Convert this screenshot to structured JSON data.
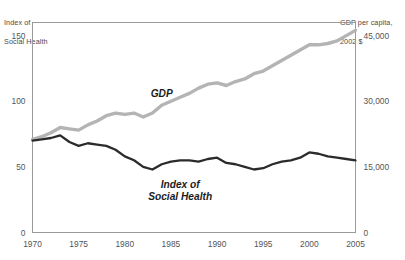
{
  "chart_data": {
    "type": "line",
    "title": "",
    "xlabel": "",
    "ylabel": "Index of\nSocial Health",
    "y2label": "GDP per capita,\n2002 $",
    "grid": false,
    "legend_position": "inline-annotations",
    "xlim": [
      1970,
      2005
    ],
    "ylim": [
      0,
      160
    ],
    "y2lim": [
      0,
      48000
    ],
    "xticks": [
      "1970",
      "1975",
      "1980",
      "1985",
      "1990",
      "1995",
      "2000",
      "2005"
    ],
    "xtick_values": [
      1970,
      1975,
      1980,
      1985,
      1990,
      1995,
      2000,
      2005
    ],
    "yticks": [
      "0",
      "50",
      "100",
      "150"
    ],
    "ytick_values": [
      0,
      50,
      100,
      150
    ],
    "y2ticks": [
      "0",
      "15,000",
      "30,000",
      "45,000"
    ],
    "y2tick_values": [
      0,
      15000,
      30000,
      45000
    ],
    "x": [
      1970,
      1971,
      1972,
      1973,
      1974,
      1975,
      1976,
      1977,
      1978,
      1979,
      1980,
      1981,
      1982,
      1983,
      1984,
      1985,
      1986,
      1987,
      1988,
      1989,
      1990,
      1991,
      1992,
      1993,
      1994,
      1995,
      1996,
      1997,
      1998,
      1999,
      2000,
      2001,
      2002,
      2003,
      2004,
      2005
    ],
    "series": [
      {
        "name": "GDP",
        "axis": "right",
        "color": "#b4b4b4",
        "label_x": 1984,
        "label_y": 103,
        "values": [
          71,
          73,
          76,
          80,
          79,
          78,
          82,
          85,
          89,
          91,
          90,
          91,
          88,
          91,
          97,
          100,
          103,
          106,
          110,
          113,
          114,
          112,
          115,
          117,
          121,
          123,
          127,
          131,
          135,
          139,
          143,
          143,
          144,
          146,
          150,
          154
        ]
      },
      {
        "name": "Index of\nSocial Health",
        "axis": "left",
        "color": "#2b2b2b",
        "label_x": 1986,
        "label_y": 34,
        "values": [
          70,
          71,
          72,
          74,
          69,
          66,
          68,
          67,
          66,
          63,
          58,
          55,
          50,
          48,
          52,
          54,
          55,
          55,
          54,
          56,
          57,
          53,
          52,
          50,
          48,
          49,
          52,
          54,
          55,
          57,
          61,
          60,
          58,
          57,
          56,
          55
        ]
      }
    ]
  },
  "annotations": {
    "gdp_label": "GDP",
    "index_label_line1": "Index of",
    "index_label_line2": "Social Health",
    "left_caption_line1": "Index of",
    "left_caption_line2": "Social Health",
    "right_caption_line1": "GDP per capita,",
    "right_caption_line2": "2002 $"
  }
}
